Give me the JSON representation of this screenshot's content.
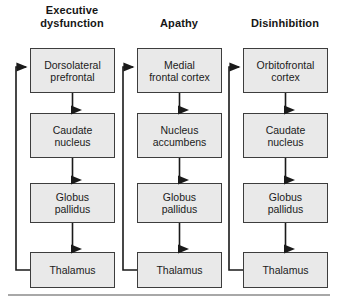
{
  "figure": {
    "type": "flow-diagram",
    "bottom_rule_color": "#a8a8a8",
    "box_fill_color": "#e9e9e9",
    "box_border_color": "#3d3d3d",
    "arrow_color": "#1a1a1a"
  },
  "columns": [
    {
      "id": "executive-dysfunction",
      "title": "Executive\ndysfunction",
      "nodes": [
        {
          "id": "dorsolateral-prefrontal",
          "label": "Dorsolateral\nprefrontal"
        },
        {
          "id": "caudate-nucleus",
          "label": "Caudate\nnucleus"
        },
        {
          "id": "globus-pallidus",
          "label": "Globus\npallidus"
        },
        {
          "id": "thalamus",
          "label": "Thalamus"
        }
      ],
      "feedback_loop": "thalamus-to-dorsolateral-prefrontal"
    },
    {
      "id": "apathy",
      "title": "Apathy",
      "nodes": [
        {
          "id": "medial-frontal-cortex",
          "label": "Medial\nfrontal cortex"
        },
        {
          "id": "nucleus-accumbens",
          "label": "Nucleus\naccumbens"
        },
        {
          "id": "globus-pallidus",
          "label": "Globus\npallidus"
        },
        {
          "id": "thalamus",
          "label": "Thalamus"
        }
      ],
      "feedback_loop": "thalamus-to-medial-frontal-cortex"
    },
    {
      "id": "disinhibition",
      "title": "Disinhibition",
      "nodes": [
        {
          "id": "orbitofrontal-cortex",
          "label": "Orbitofrontal\ncortex"
        },
        {
          "id": "caudate-nucleus",
          "label": "Caudate\nnucleus"
        },
        {
          "id": "globus-pallidus",
          "label": "Globus\npallidus"
        },
        {
          "id": "thalamus",
          "label": "Thalamus"
        }
      ],
      "feedback_loop": "thalamus-to-orbitofrontal-cortex"
    }
  ]
}
